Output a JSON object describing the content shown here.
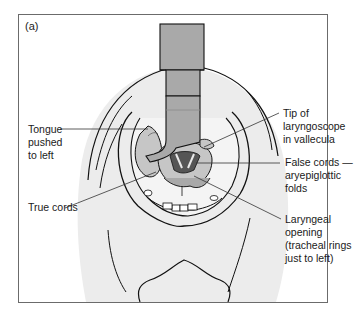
{
  "figure": {
    "panel_label": "(a)",
    "colors": {
      "skin": "#ececec",
      "instrument": "#a9a9a9",
      "instrument_dark": "#8c8c8c",
      "tissue_mid": "#c6c6c6",
      "outline": "#111111",
      "leader": "#333333"
    },
    "labels": {
      "tongue": "Tongue\npushed\nto left",
      "tip": "Tip of\nlaryngoscope\nin vallecula",
      "false_cords": "False cords —\naryepiglottic\nfolds",
      "true_cords": "True cords",
      "laryngeal_opening": "Laryngeal\nopening\n(tracheal rings\njust to left)"
    }
  }
}
